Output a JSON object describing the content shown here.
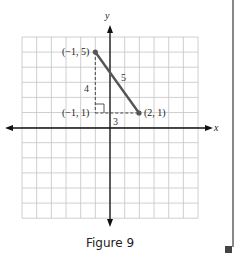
{
  "figure": {
    "caption": "Figure 9",
    "axis_x_label": "x",
    "axis_y_label": "y",
    "grid": {
      "x_min": -6,
      "x_max": 6,
      "y_min": -6,
      "y_max": 6
    },
    "points": [
      {
        "label": "(−1, 5)",
        "x": -1,
        "y": 5
      },
      {
        "label": "(−1, 1)",
        "x": -1,
        "y": 1
      },
      {
        "label": "(2, 1)",
        "x": 2,
        "y": 1
      }
    ],
    "segment_labels": {
      "hypotenuse": "5",
      "vertical_leg": "4",
      "horizontal_leg": "3"
    },
    "colors": {
      "segment": "#555555",
      "grid": "#bbbbbb",
      "axis": "#111111"
    }
  }
}
